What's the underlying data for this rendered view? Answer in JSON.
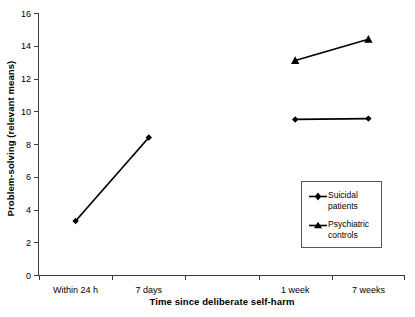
{
  "chart_data": {
    "type": "line",
    "title": "",
    "xlabel": "Time since deliberate self-harm",
    "ylabel": "Problem-solving (relevant means)",
    "ylim": [
      0,
      16
    ],
    "yticks": [
      0,
      2,
      4,
      6,
      8,
      10,
      12,
      14,
      16
    ],
    "ytick_labels": [
      "0",
      "2",
      "4",
      "6",
      "8",
      "10",
      "12",
      "14",
      "16"
    ],
    "x_positions": [
      0.5,
      1.5,
      3.5,
      4.5
    ],
    "xlim": [
      0,
      5
    ],
    "xtick_count": 6,
    "categories": [
      "Within 24 h",
      "7 days",
      "1 week",
      "7 weeks"
    ],
    "grid": false,
    "legend_position": "lower right",
    "series": [
      {
        "name": "Suicidal patients",
        "legend_label": "Suicidal\npatients",
        "marker": "diamond",
        "color": "#000000",
        "points": [
          {
            "category": "Within 24 h",
            "x": 0.5,
            "y": 3.3
          },
          {
            "category": "7 days",
            "x": 1.5,
            "y": 8.4
          },
          {
            "category": "1 week",
            "x": 3.5,
            "y": 9.5
          },
          {
            "category": "7 weeks",
            "x": 4.5,
            "y": 9.55
          }
        ],
        "segments": [
          [
            0,
            1
          ],
          [
            2,
            3
          ]
        ]
      },
      {
        "name": "Psychiatric controls",
        "legend_label": "Psychiatric\ncontrols",
        "marker": "triangle",
        "color": "#000000",
        "points": [
          {
            "category": "1 week",
            "x": 3.5,
            "y": 13.1
          },
          {
            "category": "7 weeks",
            "x": 4.5,
            "y": 14.4
          }
        ],
        "segments": [
          [
            0,
            1
          ]
        ]
      }
    ]
  }
}
